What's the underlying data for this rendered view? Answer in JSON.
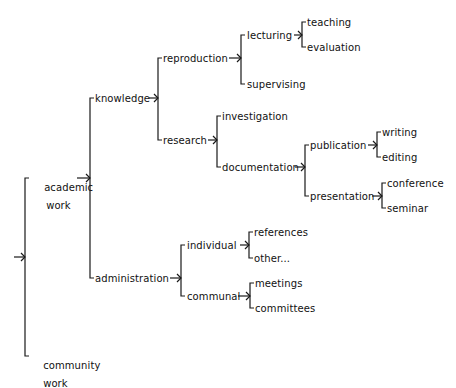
{
  "diagram": {
    "type": "tree",
    "orientation": "left-to-right",
    "line_color": "#1a1a1a",
    "text_color": "#111111",
    "root": {
      "label": "",
      "children": [
        {
          "label": "academic work",
          "children": [
            {
              "label": "knowledge",
              "children": [
                {
                  "label": "reproduction",
                  "children": [
                    {
                      "label": "lecturing",
                      "children": [
                        {
                          "label": "teaching"
                        },
                        {
                          "label": "evaluation"
                        }
                      ]
                    },
                    {
                      "label": "supervising"
                    }
                  ]
                },
                {
                  "label": "research",
                  "children": [
                    {
                      "label": "investigation"
                    },
                    {
                      "label": "documentation",
                      "children": [
                        {
                          "label": "publication",
                          "children": [
                            {
                              "label": "writing"
                            },
                            {
                              "label": "editing"
                            }
                          ]
                        },
                        {
                          "label": "presentation",
                          "children": [
                            {
                              "label": "conference"
                            },
                            {
                              "label": "seminar"
                            }
                          ]
                        }
                      ]
                    }
                  ]
                }
              ]
            },
            {
              "label": "administration",
              "children": [
                {
                  "label": "individual",
                  "children": [
                    {
                      "label": "references"
                    },
                    {
                      "label": "other..."
                    }
                  ]
                },
                {
                  "label": "communal",
                  "children": [
                    {
                      "label": "meetings"
                    },
                    {
                      "label": "committees"
                    }
                  ]
                }
              ]
            }
          ]
        },
        {
          "label": "community work"
        }
      ]
    }
  },
  "labels": {
    "academic_line1": "academic",
    "academic_line2": "work",
    "community_line1": "community",
    "community_line2": "work",
    "knowledge": "knowledge",
    "administration": "administration",
    "reproduction": "reproduction",
    "research": "research",
    "lecturing": "lecturing",
    "supervising": "supervising",
    "teaching": "teaching",
    "evaluation": "evaluation",
    "investigation": "investigation",
    "documentation": "documentation",
    "publication": "publication",
    "presentation": "presentation",
    "writing": "writing",
    "editing": "editing",
    "conference": "conference",
    "seminar": "seminar",
    "individual": "individual",
    "communal": "communal",
    "references": "references",
    "other": "other...",
    "meetings": "meetings",
    "committees": "committees"
  }
}
